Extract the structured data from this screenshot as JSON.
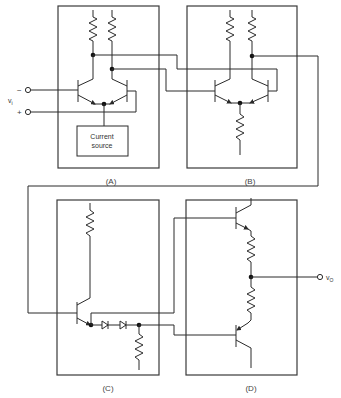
{
  "diagram": {
    "title": "",
    "blocks": [
      {
        "id": "A",
        "label": "(A)",
        "description": "Differential input stage with current source"
      },
      {
        "id": "B",
        "label": "(B)",
        "description": "Second differential amplifier stage with emitter resistor"
      },
      {
        "id": "C",
        "label": "(C)",
        "description": "Level shifter / driver transistor with diode bias string"
      },
      {
        "id": "D",
        "label": "(D)",
        "description": "Complementary push-pull output stage"
      }
    ],
    "current_source_label_1": "Current",
    "current_source_label_2": "source",
    "input_label": "v",
    "input_subscript": "i",
    "input_minus": "−",
    "input_plus": "+",
    "output_label": "v",
    "output_subscript": "O",
    "colors": {
      "line": "#2a2a2a",
      "background": "#ffffff"
    }
  }
}
